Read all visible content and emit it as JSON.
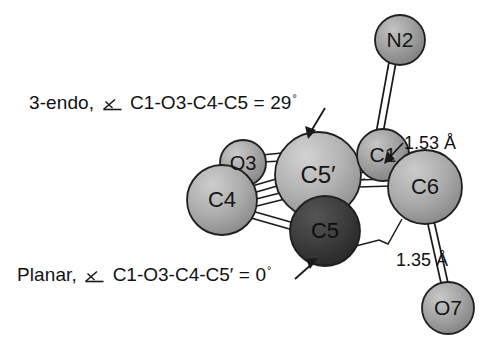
{
  "figure": {
    "type": "ball-and-stick molecular structure diagram",
    "background_color": "#ffffff"
  },
  "annotations": [
    {
      "id": "3-endo",
      "prefix": "3-endo,",
      "angle_symbol": "measured-angle",
      "torsion": "C1-O3-C4-C5",
      "equals": "=",
      "value": "29",
      "degree": "°",
      "full_text": "3-endo, ∠ C1-O3-C4-C5 = 29°",
      "arrow": "down-left to C5'"
    },
    {
      "id": "planar",
      "prefix": "Planar,",
      "angle_symbol": "measured-angle",
      "torsion": "C1-O3-C4-C5′",
      "equals": "=",
      "value": "0",
      "degree": "°",
      "full_text": "Planar, ∠ C1-O3-C4-C5′ = 0°",
      "arrow": "up-right to C5"
    }
  ],
  "bond_labels": [
    {
      "id": "c1-c6",
      "text": "1.53 Å",
      "distance": "1.53",
      "unit": "Å",
      "points_to": "C1-C6 bond"
    },
    {
      "id": "c6-o7",
      "text": "1.35 Å",
      "distance": "1.35",
      "unit": "Å",
      "points_to": "C6-O7 bond"
    }
  ],
  "atoms": [
    {
      "id": "N2",
      "label": "N2",
      "x": 400,
      "y": 40,
      "r": 25,
      "shade": "#9a9a9a",
      "font_size": 21
    },
    {
      "id": "O3",
      "label": "O3",
      "x": 243,
      "y": 163,
      "r": 23,
      "shade": "#a3a3a3",
      "font_size": 20
    },
    {
      "id": "C5p",
      "label": "C5′",
      "x": 318,
      "y": 175,
      "r": 43,
      "shade": "#b0b0b0",
      "font_size": 24
    },
    {
      "id": "C1",
      "label": "C1",
      "x": 383,
      "y": 155,
      "r": 26,
      "shade": "#9d9d9d",
      "font_size": 21
    },
    {
      "id": "C4",
      "label": "C4",
      "x": 222,
      "y": 200,
      "r": 35,
      "shade": "#aaaaaa",
      "font_size": 22
    },
    {
      "id": "C6",
      "label": "C6",
      "x": 425,
      "y": 187,
      "r": 37,
      "shade": "#a8a8a8",
      "font_size": 22
    },
    {
      "id": "C5",
      "label": "C5",
      "x": 325,
      "y": 231,
      "r": 35,
      "shade": "#3a3a3a",
      "font_size": 22
    },
    {
      "id": "O7",
      "label": "O7",
      "x": 448,
      "y": 308,
      "r": 26,
      "shade": "#a0a0a0",
      "font_size": 21
    }
  ],
  "bonds": [
    {
      "from": "C1",
      "to": "N2",
      "style": "double-line"
    },
    {
      "from": "C5p",
      "to": "O3",
      "style": "double-line"
    },
    {
      "from": "O3",
      "to": "C4",
      "style": "double-line"
    },
    {
      "from": "C5p",
      "to": "C4",
      "style": "double-line"
    },
    {
      "from": "C5p",
      "to": "C1",
      "style": "double-line"
    },
    {
      "from": "C5p",
      "to": "C6",
      "style": "double-line"
    },
    {
      "from": "C4",
      "to": "C5",
      "style": "double-line"
    },
    {
      "from": "C1",
      "to": "C6",
      "style": "double-line"
    },
    {
      "from": "C1",
      "to": "C4",
      "style": "double-line"
    },
    {
      "from": "C6",
      "to": "O7",
      "style": "double-line"
    },
    {
      "from": "C5",
      "to": "C6",
      "style": "single-thin"
    }
  ]
}
